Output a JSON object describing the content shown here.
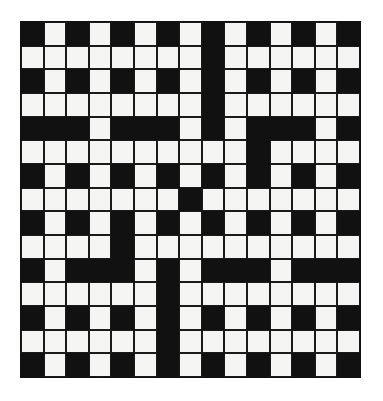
{
  "puzzle": {
    "type": "crossword-grid",
    "title": "Crossword Grid",
    "rows": 15,
    "columns": 15,
    "cell_size_px": 22.7,
    "colors": {
      "white_cell": "#f5f5f3",
      "black_cell": "#111111",
      "grid_line": "#1a1a1a",
      "page_background": "#ffffff"
    },
    "legend": {
      "black": "blocked square",
      "white": "letter square"
    },
    "grid": [
      [
        "black",
        "white",
        "black",
        "white",
        "black",
        "white",
        "black",
        "white",
        "black",
        "white",
        "black",
        "white",
        "black",
        "white",
        "black"
      ],
      [
        "white",
        "white",
        "white",
        "white",
        "white",
        "white",
        "white",
        "white",
        "black",
        "white",
        "white",
        "white",
        "white",
        "white",
        "white"
      ],
      [
        "black",
        "white",
        "black",
        "white",
        "black",
        "white",
        "black",
        "white",
        "black",
        "white",
        "black",
        "white",
        "black",
        "white",
        "black"
      ],
      [
        "white",
        "white",
        "white",
        "white",
        "white",
        "white",
        "white",
        "white",
        "black",
        "white",
        "white",
        "white",
        "white",
        "white",
        "white"
      ],
      [
        "black",
        "black",
        "black",
        "white",
        "black",
        "black",
        "black",
        "white",
        "black",
        "white",
        "black",
        "black",
        "black",
        "white",
        "black"
      ],
      [
        "white",
        "white",
        "white",
        "white",
        "white",
        "white",
        "white",
        "white",
        "white",
        "white",
        "black",
        "white",
        "white",
        "white",
        "white"
      ],
      [
        "black",
        "white",
        "black",
        "white",
        "black",
        "white",
        "black",
        "white",
        "black",
        "white",
        "black",
        "white",
        "black",
        "white",
        "black"
      ],
      [
        "white",
        "white",
        "white",
        "white",
        "white",
        "white",
        "white",
        "black",
        "white",
        "white",
        "white",
        "white",
        "white",
        "white",
        "white"
      ],
      [
        "black",
        "white",
        "black",
        "white",
        "black",
        "white",
        "black",
        "white",
        "black",
        "white",
        "black",
        "white",
        "black",
        "white",
        "black"
      ],
      [
        "white",
        "white",
        "white",
        "white",
        "black",
        "white",
        "white",
        "white",
        "white",
        "white",
        "white",
        "white",
        "white",
        "white",
        "white"
      ],
      [
        "black",
        "white",
        "black",
        "black",
        "black",
        "white",
        "black",
        "white",
        "black",
        "black",
        "black",
        "white",
        "black",
        "black",
        "black"
      ],
      [
        "white",
        "white",
        "white",
        "white",
        "white",
        "white",
        "black",
        "white",
        "white",
        "white",
        "white",
        "white",
        "white",
        "white",
        "white"
      ],
      [
        "black",
        "white",
        "black",
        "white",
        "black",
        "white",
        "black",
        "white",
        "black",
        "white",
        "black",
        "white",
        "black",
        "white",
        "black"
      ],
      [
        "white",
        "white",
        "white",
        "white",
        "white",
        "white",
        "black",
        "white",
        "white",
        "white",
        "white",
        "white",
        "white",
        "white",
        "white"
      ],
      [
        "black",
        "white",
        "black",
        "white",
        "black",
        "white",
        "black",
        "white",
        "black",
        "white",
        "black",
        "white",
        "black",
        "white",
        "black"
      ]
    ]
  }
}
